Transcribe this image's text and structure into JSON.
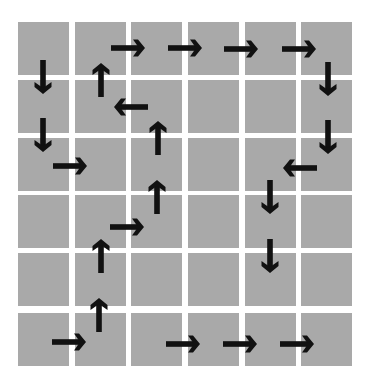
{
  "grid": {
    "rows": 6,
    "cols": 6,
    "col_x": [
      18,
      75,
      131,
      188,
      245,
      301
    ],
    "row_y": [
      22,
      80,
      138,
      195,
      253,
      313
    ],
    "cell_w": 51,
    "cell_h": 53,
    "cell_color": "#a9a9a9",
    "background": "#ffffff"
  },
  "arrow_color": "#111111",
  "arrows": [
    {
      "dir": "right",
      "x": 128,
      "y": 48
    },
    {
      "dir": "right",
      "x": 185,
      "y": 48
    },
    {
      "dir": "right",
      "x": 241,
      "y": 49
    },
    {
      "dir": "right",
      "x": 299,
      "y": 49
    },
    {
      "dir": "down",
      "x": 328,
      "y": 79
    },
    {
      "dir": "down",
      "x": 328,
      "y": 137
    },
    {
      "dir": "left",
      "x": 300,
      "y": 168
    },
    {
      "dir": "down",
      "x": 270,
      "y": 197
    },
    {
      "dir": "down",
      "x": 270,
      "y": 256
    },
    {
      "dir": "right",
      "x": 183,
      "y": 344
    },
    {
      "dir": "right",
      "x": 240,
      "y": 344
    },
    {
      "dir": "right",
      "x": 297,
      "y": 344
    },
    {
      "dir": "down",
      "x": 43,
      "y": 77
    },
    {
      "dir": "down",
      "x": 43,
      "y": 135
    },
    {
      "dir": "right",
      "x": 70,
      "y": 166
    },
    {
      "dir": "up",
      "x": 101,
      "y": 80
    },
    {
      "dir": "left",
      "x": 131,
      "y": 107
    },
    {
      "dir": "up",
      "x": 158,
      "y": 138
    },
    {
      "dir": "up",
      "x": 157,
      "y": 197
    },
    {
      "dir": "right",
      "x": 127,
      "y": 227
    },
    {
      "dir": "up",
      "x": 101,
      "y": 256
    },
    {
      "dir": "up",
      "x": 99,
      "y": 315
    },
    {
      "dir": "right",
      "x": 69,
      "y": 342
    }
  ]
}
